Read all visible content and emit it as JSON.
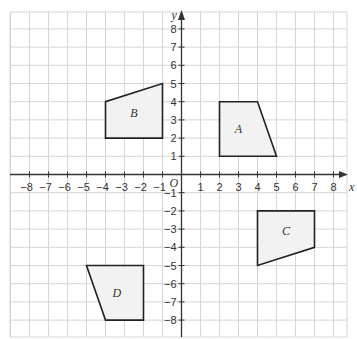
{
  "diagram": {
    "type": "coordinate-grid",
    "axes": {
      "x_label": "x",
      "y_label": "y",
      "origin_label": "O",
      "x_range": [
        -8,
        8
      ],
      "y_range": [
        -8,
        8
      ],
      "x_ticks": [
        -8,
        -7,
        -6,
        -5,
        -4,
        -3,
        -2,
        -1,
        1,
        2,
        3,
        4,
        5,
        6,
        7,
        8
      ],
      "y_ticks": [
        8,
        7,
        6,
        5,
        4,
        3,
        2,
        1,
        -1,
        -2,
        -3,
        -4,
        -5,
        -6,
        -7,
        -8
      ]
    },
    "shapes": [
      {
        "label": "A",
        "vertices": [
          [
            2,
            1
          ],
          [
            2,
            4
          ],
          [
            4,
            4
          ],
          [
            5,
            1
          ]
        ],
        "label_pos": [
          3,
          2.5
        ]
      },
      {
        "label": "B",
        "vertices": [
          [
            -4,
            2
          ],
          [
            -4,
            4
          ],
          [
            -1,
            5
          ],
          [
            -1,
            2
          ]
        ],
        "label_pos": [
          -2.5,
          3.4
        ]
      },
      {
        "label": "C",
        "vertices": [
          [
            4,
            -2
          ],
          [
            7,
            -2
          ],
          [
            7,
            -4
          ],
          [
            4,
            -5
          ]
        ],
        "label_pos": [
          5.5,
          -3.1
        ]
      },
      {
        "label": "D",
        "vertices": [
          [
            -5,
            -5
          ],
          [
            -2,
            -5
          ],
          [
            -2,
            -8
          ],
          [
            -4,
            -8
          ]
        ],
        "label_pos": [
          -3.4,
          -6.5
        ]
      }
    ],
    "colors": {
      "grid": "#d6d6d6",
      "axis": "#333333",
      "shape_stroke": "#222222",
      "shape_fill": "#f2f2f2"
    }
  }
}
